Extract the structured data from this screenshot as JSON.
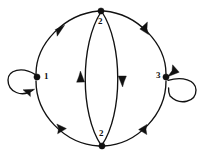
{
  "figure": {
    "kind": "directed-multigraph",
    "background_color": "#ffffff",
    "ink_color": "#111111"
  },
  "nodes": [
    {
      "id": "left",
      "label": "1",
      "cx": 37,
      "cy": 77,
      "r": 3.1,
      "label_x": 44,
      "label_y": 73
    },
    {
      "id": "top",
      "label": "2",
      "cx": 101,
      "cy": 11,
      "r": 3.1,
      "label_x": 98,
      "label_y": 17
    },
    {
      "id": "bottom",
      "label": "2",
      "cx": 102,
      "cy": 146,
      "r": 3.1,
      "label_x": 99,
      "label_y": 131
    },
    {
      "id": "right",
      "label": "3",
      "cx": 166,
      "cy": 77,
      "r": 3.1,
      "label_x": 157,
      "label_y": 72
    }
  ],
  "edges": [
    {
      "id": "left-to-top",
      "from": "left",
      "to": "top",
      "direction": "up-right",
      "arrow_at": "mid"
    },
    {
      "id": "top-to-right",
      "from": "top",
      "to": "right",
      "direction": "down-right",
      "arrow_at": "mid"
    },
    {
      "id": "bottom-to-left",
      "from": "bottom",
      "to": "left",
      "direction": "up-left",
      "arrow_at": "mid"
    },
    {
      "id": "right-to-bottom",
      "from": "right",
      "to": "bottom",
      "direction": "down-left",
      "arrow_at": "mid"
    },
    {
      "id": "bottom-to-top-inner-left",
      "from": "bottom",
      "to": "top",
      "direction": "up",
      "arrow_at": "mid"
    },
    {
      "id": "top-to-bottom-inner-right",
      "from": "top",
      "to": "bottom",
      "direction": "down",
      "arrow_at": "mid"
    }
  ],
  "self_loops": [
    {
      "id": "loop-left",
      "node": "left",
      "side": "left",
      "orientation": "clockwise"
    },
    {
      "id": "loop-right",
      "node": "right",
      "side": "right",
      "orientation": "counter-clockwise"
    }
  ]
}
